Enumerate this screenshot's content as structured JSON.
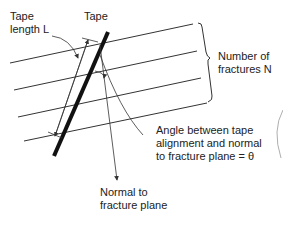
{
  "labels": {
    "tape_length": "Tape\nlength L",
    "tape": "Tape",
    "number_of_fractures": "Number of\nfractures N",
    "angle": "Angle between tape\nalignment and normal\nto fracture plane = θ",
    "normal": "Normal to\nfracture plane"
  },
  "colors": {
    "line": "#333333",
    "tape": "#111111",
    "text": "#222222"
  }
}
